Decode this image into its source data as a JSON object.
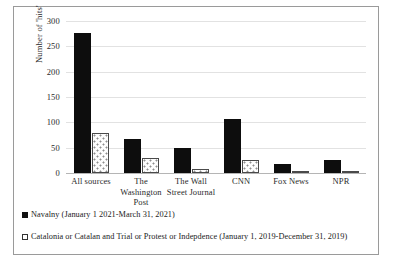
{
  "chart_data": {
    "type": "bar",
    "title": "",
    "xlabel": "",
    "ylabel": "Number of 'hits'",
    "ylim": [
      0,
      300
    ],
    "yticks": [
      0,
      50,
      100,
      150,
      200,
      250,
      300
    ],
    "grid": true,
    "legend_position": "bottom-left",
    "categories": [
      "All sources",
      "The Washington Post",
      "The Wall Street Journal",
      "CNN",
      "Fox News",
      "NPR"
    ],
    "category_lines": [
      [
        "All sources"
      ],
      [
        "The",
        "Washington",
        "Post"
      ],
      [
        "The Wall",
        "Street Journal"
      ],
      [
        "CNN"
      ],
      [
        "Fox News"
      ],
      [
        "NPR"
      ]
    ],
    "series": [
      {
        "name": "Navalny (January 1 2021-March 31, 2021)",
        "values": [
          276,
          67,
          49,
          106,
          17,
          26
        ]
      },
      {
        "name": "Catalonia or Catalan and Trial or Protest or Indepdence (January 1, 2019-December 31, 2019)",
        "values": [
          78,
          30,
          8,
          25,
          2,
          4
        ]
      }
    ]
  },
  "legend": {
    "entries": [
      {
        "label": "Navalny (January 1 2021-March 31, 2021)",
        "marker": "filled-square",
        "color": "#111111"
      },
      {
        "label": "Catalonia or Catalan and Trial or Protest or Indepdence (January 1, 2019-December 31, 2019)",
        "marker": "hollow-square",
        "color": "#ffffff"
      }
    ]
  }
}
